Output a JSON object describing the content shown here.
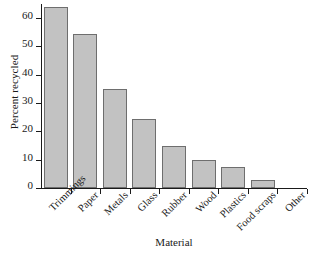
{
  "chart_data": {
    "type": "bar",
    "title": "",
    "xlabel": "Material",
    "ylabel": "Percent recycled",
    "categories": [
      "Trimmings",
      "Paper",
      "Metals",
      "Glass",
      "Rubber",
      "Wood",
      "Plastics",
      "Food scraps",
      "Other"
    ],
    "values": [
      64,
      54.5,
      35,
      24.5,
      15,
      10,
      7.5,
      3,
      0
    ],
    "ylim": [
      0,
      65
    ],
    "yticks": [
      0,
      10,
      20,
      30,
      40,
      50,
      60
    ],
    "ytick_labels": [
      "0",
      "10",
      "20",
      "30",
      "40",
      "50",
      "60"
    ],
    "grid": false,
    "legend": "none",
    "bar_fill": "#c2c2c2",
    "bar_edge": "#6e6e6e",
    "axis_color": "#1a1a1a",
    "background": "#ffffff"
  }
}
